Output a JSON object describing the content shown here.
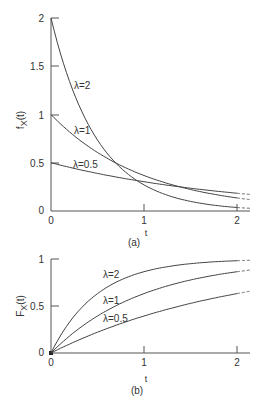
{
  "chart_data": [
    {
      "type": "line",
      "panel_label": "(a)",
      "title": "",
      "xlabel": "t",
      "ylabel": "f_X(t)",
      "xlim": [
        0,
        2.15
      ],
      "ylim": [
        0,
        2
      ],
      "x_ticks": [
        "0",
        "1",
        "2"
      ],
      "y_ticks": [
        "0",
        "0.5",
        "1",
        "1.5",
        "2"
      ],
      "grid": false,
      "function": "lambda * exp(-lambda * t)",
      "series": [
        {
          "name": "λ=2",
          "lambda": 2,
          "x": [
            0,
            0.25,
            0.5,
            0.75,
            1,
            1.5,
            2
          ],
          "values": [
            2,
            1.21,
            0.74,
            0.45,
            0.27,
            0.1,
            0.04
          ]
        },
        {
          "name": "λ=1",
          "lambda": 1,
          "x": [
            0,
            0.25,
            0.5,
            0.75,
            1,
            1.5,
            2
          ],
          "values": [
            1,
            0.78,
            0.61,
            0.47,
            0.37,
            0.22,
            0.14
          ]
        },
        {
          "name": "λ=0.5",
          "lambda": 0.5,
          "x": [
            0,
            0.25,
            0.5,
            0.75,
            1,
            1.5,
            2
          ],
          "values": [
            0.5,
            0.44,
            0.39,
            0.34,
            0.3,
            0.24,
            0.18
          ]
        }
      ],
      "annotations": [
        "λ=2",
        "λ=1",
        "λ=0.5"
      ]
    },
    {
      "type": "line",
      "panel_label": "(b)",
      "title": "",
      "xlabel": "t",
      "ylabel": "F_X(t)",
      "xlim": [
        0,
        2.15
      ],
      "ylim": [
        0,
        1
      ],
      "x_ticks": [
        "0",
        "1",
        "2"
      ],
      "y_ticks": [
        "0",
        "0.5",
        "1"
      ],
      "grid": false,
      "function": "1 - exp(-lambda * t)",
      "series": [
        {
          "name": "λ=2",
          "lambda": 2,
          "x": [
            0,
            0.25,
            0.5,
            0.75,
            1,
            1.5,
            2
          ],
          "values": [
            0,
            0.39,
            0.63,
            0.78,
            0.86,
            0.95,
            0.98
          ]
        },
        {
          "name": "λ=1",
          "lambda": 1,
          "x": [
            0,
            0.25,
            0.5,
            0.75,
            1,
            1.5,
            2
          ],
          "values": [
            0,
            0.22,
            0.39,
            0.53,
            0.63,
            0.78,
            0.86
          ]
        },
        {
          "name": "λ=0.5",
          "lambda": 0.5,
          "x": [
            0,
            0.25,
            0.5,
            0.75,
            1,
            1.5,
            2
          ],
          "values": [
            0,
            0.12,
            0.22,
            0.31,
            0.39,
            0.53,
            0.63
          ]
        }
      ],
      "annotations": [
        "λ=2",
        "λ=1",
        "λ=0.5"
      ]
    }
  ],
  "labels": {
    "a": {
      "ylabel_main": "f",
      "ylabel_sub": "X",
      "ylabel_arg": "(t)",
      "xlabel": "t",
      "panel": "(a)",
      "y_ticks": [
        "2",
        "1.5",
        "1",
        "0.5",
        "0"
      ],
      "x_ticks": [
        "0",
        "1",
        "2"
      ],
      "curve_labels": [
        "λ=2",
        "λ=1",
        "λ=0.5"
      ]
    },
    "b": {
      "ylabel_main": "F",
      "ylabel_sub": "X",
      "ylabel_arg": "(t)",
      "xlabel": "t",
      "panel": "(b)",
      "y_ticks": [
        "1",
        "0.5",
        "0"
      ],
      "x_ticks": [
        "0",
        "1",
        "2"
      ],
      "curve_labels": [
        "λ=2",
        "λ=1",
        "λ=0.5"
      ]
    }
  },
  "layout": {
    "x0": 51,
    "xscale": 93,
    "xmax": 2.0,
    "xdash_end": 2.15,
    "a": {
      "y0": 211,
      "yscale": 96.5
    },
    "b": {
      "y0": 353,
      "yscale": 94
    },
    "colors": {
      "curve": "#444444",
      "axis": "#555555",
      "text": "#333333"
    }
  }
}
